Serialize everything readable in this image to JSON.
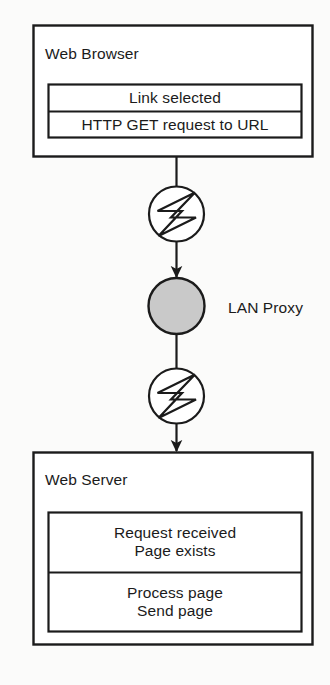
{
  "diagram": {
    "type": "flowchart",
    "colors": {
      "line": "#1b1b1b",
      "text": "#1b1b1b",
      "background": "#fbfbfa",
      "proxy_fill": "#c9c9c9"
    },
    "nodes": {
      "browser": {
        "title": "Web Browser",
        "rows": [
          "Link selected",
          "HTTP GET request to URL"
        ]
      },
      "server": {
        "title": "Web Server",
        "rows": [
          "Request received\nPage exists",
          "Process page\nSend page"
        ]
      },
      "proxy": {
        "label": "LAN Proxy"
      }
    },
    "connectors": [
      {
        "from": "browser",
        "to": "link-upper",
        "icon": "lightning-bolt-icon",
        "arrow": "down"
      },
      {
        "from": "link-upper",
        "to": "proxy",
        "arrow": "down"
      },
      {
        "from": "proxy",
        "to": "link-lower",
        "icon": "lightning-bolt-icon",
        "arrow": "down"
      },
      {
        "from": "link-lower",
        "to": "server",
        "arrow": "down"
      }
    ]
  }
}
